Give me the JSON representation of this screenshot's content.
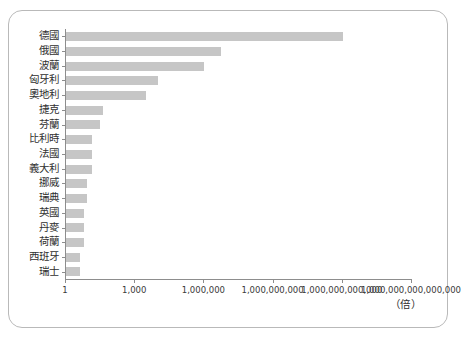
{
  "chart_data": {
    "type": "bar",
    "orientation": "horizontal",
    "title": "",
    "xlabel": "（倍）",
    "ylabel": "",
    "scale": "log",
    "xlim": [
      1,
      1000000000000000
    ],
    "grid": false,
    "legend": null,
    "bar_color": "#c6c6c6",
    "axis_color": "#8d8d8d",
    "frame_color": "#b9b9b9",
    "categories": [
      "德國",
      "俄國",
      "波蘭",
      "匈牙利",
      "奧地利",
      "捷克",
      "芬蘭",
      "比利時",
      "法國",
      "義大利",
      "挪威",
      "瑞典",
      "英國",
      "丹麥",
      "荷蘭",
      "西班牙",
      "瑞士"
    ],
    "values": [
      1000000000000,
      5000000,
      1000000,
      10000,
      3000,
      40,
      30,
      14,
      14,
      13,
      8,
      8,
      6,
      6,
      6,
      4,
      4
    ],
    "tick_labels": [
      "1",
      "1,000",
      "1,000,000",
      "1,000,000,000",
      "1,000,000,000,000",
      "1,000,000,000,000,000"
    ],
    "tick_values": [
      1,
      1000,
      1000000,
      1000000000,
      1000000000000,
      1000000000000000
    ]
  },
  "unit_caption": "（倍）"
}
